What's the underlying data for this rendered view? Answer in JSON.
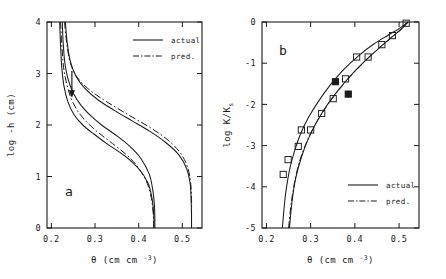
{
  "figure": {
    "background": "#ffffff",
    "ink": "#1a1a1a",
    "width": 446,
    "height": 279
  },
  "panels": [
    {
      "id": "a",
      "label": "a",
      "xlabel_theta": "θ",
      "xlabel_units": "(cm cm",
      "xlabel_exp": "-3",
      "xlabel_close": ")",
      "ylabel": "log -h (cm)",
      "xticks": [
        "0.2",
        "0.3",
        "0.4",
        "0.5"
      ],
      "xtickvals": [
        0.2,
        0.3,
        0.4,
        0.5
      ],
      "yticks": [
        "0",
        "1",
        "2",
        "3",
        "4"
      ],
      "ytickvals": [
        0,
        1,
        2,
        3,
        4
      ],
      "xlim": [
        0.19,
        0.545
      ],
      "ylim": [
        0,
        4
      ],
      "legend": [
        {
          "label": "actual",
          "style": "solid"
        },
        {
          "label": "pred.",
          "style": "dashdot"
        }
      ],
      "annotation": {
        "name": "down-arrow",
        "x": 0.247,
        "y_from": 3.05,
        "y_to": 2.58
      }
    },
    {
      "id": "b",
      "label": "b",
      "xlabel_theta": "θ",
      "xlabel_units": "(cm cm",
      "xlabel_exp": "-3",
      "xlabel_close": ")",
      "ylabel_pre": "log K/K",
      "ylabel_sub": "s",
      "xticks": [
        "0.2",
        "0.3",
        "0.4",
        "0.5"
      ],
      "xtickvals": [
        0.2,
        0.3,
        0.4,
        0.5
      ],
      "yticks": [
        "0",
        "-1",
        "-2",
        "-3",
        "-4",
        "-5"
      ],
      "ytickvals": [
        0,
        -1,
        -2,
        -3,
        -4,
        -5
      ],
      "xlim": [
        0.19,
        0.545
      ],
      "ylim": [
        -5,
        0
      ],
      "legend": [
        {
          "label": "actual",
          "style": "solid"
        },
        {
          "label": "pred.",
          "style": "dashdot"
        }
      ]
    }
  ],
  "chart_data": [
    {
      "type": "line",
      "panel": "a",
      "title": "",
      "xlabel": "θ (cm cm-3)",
      "ylabel": "log -h (cm)",
      "xlim": [
        0.19,
        0.545
      ],
      "ylim": [
        0,
        4
      ],
      "grid": false,
      "legend_position": "upper-right",
      "legend": [
        "actual",
        "pred."
      ],
      "axis_note": "x = volumetric water content theta; y = log of matric suction head",
      "series": [
        {
          "name": "loop1-drying-actual",
          "style": "solid",
          "x": [
            0.225,
            0.227,
            0.231,
            0.238,
            0.25,
            0.268,
            0.29,
            0.315,
            0.345,
            0.378,
            0.405,
            0.424,
            0.432,
            0.436,
            0.437,
            0.437
          ],
          "y": [
            4.0,
            3.6,
            3.2,
            2.9,
            2.62,
            2.38,
            2.18,
            2.0,
            1.82,
            1.6,
            1.35,
            1.05,
            0.75,
            0.45,
            0.2,
            0.0
          ]
        },
        {
          "name": "loop1-wetting-actual",
          "style": "solid",
          "x": [
            0.219,
            0.221,
            0.224,
            0.229,
            0.238,
            0.252,
            0.272,
            0.298,
            0.33,
            0.368,
            0.4,
            0.421,
            0.43,
            0.434,
            0.435,
            0.435
          ],
          "y": [
            4.0,
            3.55,
            3.1,
            2.75,
            2.45,
            2.2,
            2.0,
            1.82,
            1.62,
            1.4,
            1.15,
            0.88,
            0.6,
            0.32,
            0.12,
            0.0
          ]
        },
        {
          "name": "loop1-pred",
          "style": "dashdot",
          "x": [
            0.221,
            0.224,
            0.228,
            0.235,
            0.246,
            0.262,
            0.283,
            0.308,
            0.34,
            0.375,
            0.402,
            0.42,
            0.429,
            0.433,
            0.434,
            0.434
          ],
          "y": [
            4.0,
            3.55,
            3.12,
            2.8,
            2.5,
            2.25,
            2.04,
            1.85,
            1.64,
            1.4,
            1.14,
            0.86,
            0.58,
            0.3,
            0.12,
            0.0
          ]
        },
        {
          "name": "loop2-drying-actual",
          "style": "solid",
          "x": [
            0.232,
            0.236,
            0.243,
            0.256,
            0.278,
            0.308,
            0.345,
            0.385,
            0.425,
            0.462,
            0.492,
            0.51,
            0.518,
            0.52,
            0.521,
            0.521
          ],
          "y": [
            4.0,
            3.62,
            3.25,
            2.95,
            2.7,
            2.48,
            2.28,
            2.08,
            1.88,
            1.66,
            1.42,
            1.15,
            0.85,
            0.55,
            0.25,
            0.0
          ]
        },
        {
          "name": "loop2-pred",
          "style": "dashdot",
          "x": [
            0.23,
            0.235,
            0.243,
            0.258,
            0.282,
            0.314,
            0.352,
            0.392,
            0.432,
            0.468,
            0.496,
            0.512,
            0.519,
            0.521,
            0.521,
            0.521
          ],
          "y": [
            4.0,
            3.6,
            3.22,
            2.94,
            2.72,
            2.52,
            2.32,
            2.12,
            1.92,
            1.7,
            1.45,
            1.18,
            0.88,
            0.58,
            0.28,
            0.0
          ]
        }
      ]
    },
    {
      "type": "scatter",
      "panel": "b",
      "title": "",
      "xlabel": "θ (cm cm-3)",
      "ylabel": "log K/Ks",
      "xlim": [
        0.19,
        0.545
      ],
      "ylim": [
        -5,
        0
      ],
      "grid": false,
      "legend_position": "lower-right",
      "legend": [
        "actual",
        "pred."
      ],
      "axis_note": "x = volumetric water content theta; y = log relative hydraulic conductivity",
      "series": [
        {
          "name": "branch-upper-actual",
          "style": "solid",
          "x": [
            0.236,
            0.243,
            0.252,
            0.263,
            0.277,
            0.295,
            0.318,
            0.345,
            0.375,
            0.408,
            0.442,
            0.475,
            0.5,
            0.515,
            0.519
          ],
          "y": [
            -5.0,
            -4.2,
            -3.6,
            -3.15,
            -2.72,
            -2.32,
            -1.92,
            -1.52,
            -1.15,
            -0.82,
            -0.54,
            -0.32,
            -0.16,
            -0.04,
            0.0
          ]
        },
        {
          "name": "branch-lower-actual",
          "style": "solid",
          "x": [
            0.252,
            0.258,
            0.266,
            0.278,
            0.293,
            0.312,
            0.335,
            0.362,
            0.392,
            0.424,
            0.456,
            0.484,
            0.505,
            0.516,
            0.52
          ],
          "y": [
            -5.0,
            -4.35,
            -3.8,
            -3.32,
            -2.88,
            -2.46,
            -2.05,
            -1.66,
            -1.28,
            -0.93,
            -0.62,
            -0.36,
            -0.17,
            -0.05,
            0.0
          ]
        },
        {
          "name": "branch-lower-pred",
          "style": "dashdot",
          "x": [
            0.25,
            0.257,
            0.266,
            0.278,
            0.294,
            0.314,
            0.338,
            0.365,
            0.395,
            0.427,
            0.458,
            0.486,
            0.506,
            0.517,
            0.52
          ],
          "y": [
            -5.0,
            -4.32,
            -3.76,
            -3.28,
            -2.84,
            -2.42,
            -2.02,
            -1.63,
            -1.26,
            -0.91,
            -0.6,
            -0.35,
            -0.16,
            -0.04,
            0.0
          ]
        }
      ],
      "points_open": {
        "name": "open-square-markers",
        "marker": "open-square",
        "x": [
          0.238,
          0.249,
          0.272,
          0.279,
          0.3,
          0.325,
          0.351,
          0.379,
          0.404,
          0.43,
          0.461,
          0.485,
          0.516
        ],
        "y": [
          -3.7,
          -3.34,
          -3.02,
          -2.62,
          -2.62,
          -2.22,
          -1.86,
          -1.38,
          -0.85,
          -0.85,
          -0.55,
          -0.33,
          -0.03
        ]
      },
      "points_filled": {
        "name": "filled-square-markers",
        "marker": "filled-square",
        "x": [
          0.356,
          0.385
        ],
        "y": [
          -1.45,
          -1.75
        ]
      }
    }
  ]
}
